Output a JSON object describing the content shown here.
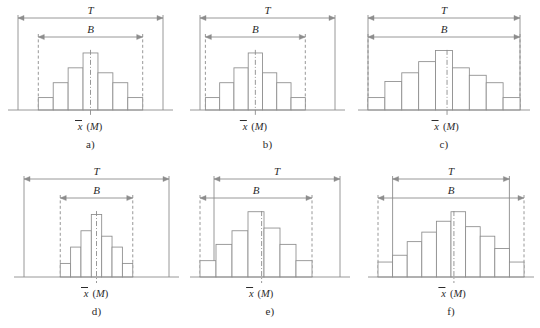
{
  "figure": {
    "title": "",
    "axis_label": "x (M)",
    "axis_label_var": "x",
    "axis_label_unit": "(M)",
    "span_labels": {
      "tolerance": "T",
      "spread": "B"
    },
    "stroke_color": "#8c8c8c",
    "text_color": "#2b2b2b",
    "background": "#ffffff"
  },
  "chart_data": {
    "type": "bar",
    "xlabel": "x (M)",
    "ylabel": "",
    "grid": false,
    "legend": null,
    "panels": [
      {
        "id": "a",
        "caption": "a)",
        "categories": [
          "1",
          "2",
          "3",
          "4",
          "5",
          "6",
          "7"
        ],
        "values": [
          1.0,
          2.2,
          3.4,
          4.6,
          3.0,
          2.2,
          1.0
        ],
        "ylim": [
          0,
          5
        ],
        "tolerance_span": [
          0.0,
          1.0
        ],
        "spread_span": [
          0.14,
          0.86
        ],
        "center": 0.5,
        "annotations": [
          "B inside T",
          "centered"
        ]
      },
      {
        "id": "b",
        "caption": "b)",
        "categories": [
          "1",
          "2",
          "3",
          "4",
          "5",
          "6",
          "7"
        ],
        "values": [
          1.0,
          2.2,
          3.4,
          4.6,
          3.0,
          2.2,
          1.0
        ],
        "ylim": [
          0,
          5
        ],
        "tolerance_span": [
          0.0,
          1.0
        ],
        "spread_span": [
          0.04,
          0.78
        ],
        "center": 0.41,
        "annotations": [
          "B inside T",
          "shifted left"
        ]
      },
      {
        "id": "c",
        "caption": "c)",
        "categories": [
          "1",
          "2",
          "3",
          "4",
          "5",
          "6",
          "7",
          "8",
          "9"
        ],
        "values": [
          1.0,
          2.3,
          3.0,
          3.9,
          4.8,
          3.4,
          2.8,
          2.2,
          1.0
        ],
        "ylim": [
          0,
          5
        ],
        "tolerance_span": [
          0.0,
          1.0
        ],
        "spread_span": [
          0.0,
          1.0
        ],
        "center": 0.52,
        "annotations": [
          "B equals T"
        ]
      },
      {
        "id": "d",
        "caption": "d)",
        "categories": [
          "1",
          "2",
          "3",
          "4",
          "5",
          "6",
          "7"
        ],
        "values": [
          1.0,
          2.2,
          3.4,
          4.6,
          3.0,
          2.2,
          1.0
        ],
        "ylim": [
          0,
          5
        ],
        "tolerance_span": [
          0.0,
          1.0
        ],
        "spread_span": [
          0.25,
          0.75
        ],
        "center": 0.5,
        "annotations": [
          "B much narrower than T"
        ]
      },
      {
        "id": "e",
        "caption": "e)",
        "categories": [
          "1",
          "2",
          "3",
          "4",
          "5",
          "6",
          "7"
        ],
        "values": [
          1.2,
          2.4,
          3.4,
          4.8,
          3.6,
          2.4,
          1.2
        ],
        "ylim": [
          0,
          5
        ],
        "tolerance_span": [
          0.1,
          1.0
        ],
        "spread_span": [
          0.0,
          0.8
        ],
        "center": 0.44,
        "annotations": [
          "B extends left of T"
        ]
      },
      {
        "id": "f",
        "caption": "f)",
        "categories": [
          "1",
          "2",
          "3",
          "4",
          "5",
          "6",
          "7",
          "8",
          "9",
          "10"
        ],
        "values": [
          1.1,
          1.6,
          2.6,
          3.3,
          4.1,
          4.8,
          3.7,
          3.0,
          2.1,
          1.1
        ],
        "ylim": [
          0,
          5
        ],
        "tolerance_span": [
          0.1,
          0.9
        ],
        "spread_span": [
          0.0,
          1.0
        ],
        "center": 0.52,
        "annotations": [
          "B wider than T on both sides"
        ]
      }
    ]
  }
}
